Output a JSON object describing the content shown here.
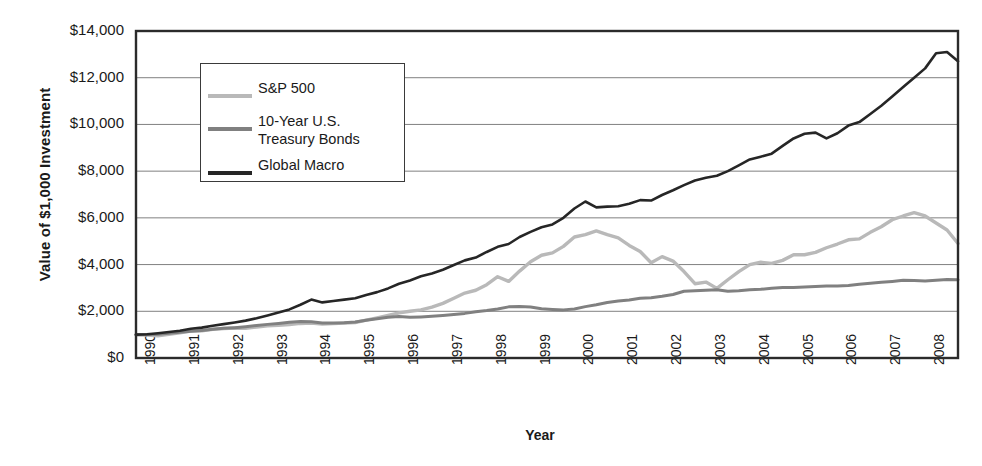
{
  "chart_data": {
    "type": "line",
    "title": "",
    "xlabel": "Year",
    "ylabel": "Value of $1,000 Investment",
    "xlim": [
      1990,
      2008.75
    ],
    "ylim": [
      0,
      14000
    ],
    "grid": true,
    "legend_position": "upper-left-inside",
    "y_ticks": [
      "$0",
      "$2,000",
      "$4,000",
      "$6,000",
      "$8,000",
      "$10,000",
      "$12,000",
      "$14,000"
    ],
    "y_tick_values": [
      0,
      2000,
      4000,
      6000,
      8000,
      10000,
      12000,
      14000
    ],
    "x_ticks": [
      "1990",
      "1991",
      "1992",
      "1993",
      "1994",
      "1995",
      "1996",
      "1997",
      "1998",
      "1999",
      "2000",
      "2001",
      "2002",
      "2003",
      "2004",
      "2005",
      "2006",
      "2007",
      "2008"
    ],
    "x_tick_values": [
      1990,
      1991,
      1992,
      1993,
      1994,
      1995,
      1996,
      1997,
      1998,
      1999,
      2000,
      2001,
      2002,
      2003,
      2004,
      2005,
      2006,
      2007,
      2008
    ],
    "colors": {
      "sp500": "#b9b9b9",
      "treasury": "#808080",
      "global_macro": "#262626",
      "axis": "#2b2b2b",
      "grid": "#808080",
      "background": "#ffffff"
    },
    "series": [
      {
        "name": "S&P 500",
        "color": "#b9b9b9",
        "x": [
          1990.0,
          1990.25,
          1990.5,
          1990.75,
          1991.0,
          1991.25,
          1991.5,
          1991.75,
          1992.0,
          1992.25,
          1992.5,
          1992.75,
          1993.0,
          1993.25,
          1993.5,
          1993.75,
          1994.0,
          1994.25,
          1994.5,
          1994.75,
          1995.0,
          1995.25,
          1995.5,
          1995.75,
          1996.0,
          1996.25,
          1996.5,
          1996.75,
          1997.0,
          1997.25,
          1997.5,
          1997.75,
          1998.0,
          1998.25,
          1998.5,
          1998.75,
          1999.0,
          1999.25,
          1999.5,
          1999.75,
          2000.0,
          2000.25,
          2000.5,
          2000.75,
          2001.0,
          2001.25,
          2001.5,
          2001.75,
          2002.0,
          2002.25,
          2002.5,
          2002.75,
          2003.0,
          2003.25,
          2003.5,
          2003.75,
          2004.0,
          2004.25,
          2004.5,
          2004.75,
          2005.0,
          2005.25,
          2005.5,
          2005.75,
          2006.0,
          2006.25,
          2006.5,
          2006.75,
          2007.0,
          2007.25,
          2007.5,
          2007.75,
          2008.0,
          2008.25,
          2008.5,
          2008.75
        ],
        "y": [
          1000,
          980,
          950,
          1010,
          1080,
          1150,
          1160,
          1230,
          1260,
          1280,
          1270,
          1330,
          1380,
          1400,
          1430,
          1480,
          1500,
          1450,
          1470,
          1500,
          1520,
          1620,
          1720,
          1820,
          1930,
          2000,
          2060,
          2180,
          2340,
          2560,
          2780,
          2900,
          3140,
          3480,
          3280,
          3720,
          4120,
          4400,
          4500,
          4780,
          5180,
          5280,
          5440,
          5280,
          5140,
          4820,
          4560,
          4080,
          4340,
          4150,
          3700,
          3180,
          3250,
          2980,
          3350,
          3700,
          4000,
          4100,
          4050,
          4180,
          4420,
          4420,
          4520,
          4720,
          4880,
          5060,
          5100,
          5380,
          5620,
          5920,
          6080,
          6220,
          6080,
          5780,
          5480,
          4900
        ]
      },
      {
        "name": "10-Year U.S. Treasury Bonds",
        "color": "#808080",
        "x": [
          1990.0,
          1990.25,
          1990.5,
          1990.75,
          1991.0,
          1991.25,
          1991.5,
          1991.75,
          1992.0,
          1992.25,
          1992.5,
          1992.75,
          1993.0,
          1993.25,
          1993.5,
          1993.75,
          1994.0,
          1994.25,
          1994.5,
          1994.75,
          1995.0,
          1995.25,
          1995.5,
          1995.75,
          1996.0,
          1996.25,
          1996.5,
          1996.75,
          1997.0,
          1997.25,
          1997.5,
          1997.75,
          1998.0,
          1998.25,
          1998.5,
          1998.75,
          1999.0,
          1999.25,
          1999.5,
          1999.75,
          2000.0,
          2000.25,
          2000.5,
          2000.75,
          2001.0,
          2001.25,
          2001.5,
          2001.75,
          2002.0,
          2002.25,
          2002.5,
          2002.75,
          2003.0,
          2003.25,
          2003.5,
          2003.75,
          2004.0,
          2004.25,
          2004.5,
          2004.75,
          2005.0,
          2005.25,
          2005.5,
          2005.75,
          2006.0,
          2006.25,
          2006.5,
          2006.75,
          2007.0,
          2007.25,
          2007.5,
          2007.75,
          2008.0,
          2008.25,
          2008.5,
          2008.75
        ],
        "y": [
          1000,
          1010,
          1020,
          1060,
          1100,
          1140,
          1180,
          1230,
          1270,
          1300,
          1340,
          1390,
          1440,
          1480,
          1530,
          1560,
          1550,
          1500,
          1500,
          1510,
          1540,
          1620,
          1680,
          1740,
          1780,
          1740,
          1760,
          1790,
          1820,
          1860,
          1910,
          1980,
          2030,
          2100,
          2190,
          2200,
          2180,
          2110,
          2080,
          2060,
          2100,
          2200,
          2280,
          2380,
          2440,
          2480,
          2560,
          2580,
          2640,
          2720,
          2860,
          2880,
          2900,
          2920,
          2860,
          2880,
          2920,
          2940,
          2990,
          3020,
          3020,
          3040,
          3060,
          3080,
          3080,
          3100,
          3160,
          3200,
          3240,
          3280,
          3330,
          3320,
          3300,
          3330,
          3360,
          3350
        ]
      },
      {
        "name": "Global Macro",
        "color": "#262626",
        "x": [
          1990.0,
          1990.25,
          1990.5,
          1990.75,
          1991.0,
          1991.25,
          1991.5,
          1991.75,
          1992.0,
          1992.25,
          1992.5,
          1992.75,
          1993.0,
          1993.25,
          1993.5,
          1993.75,
          1994.0,
          1994.25,
          1994.5,
          1994.75,
          1995.0,
          1995.25,
          1995.5,
          1995.75,
          1996.0,
          1996.25,
          1996.5,
          1996.75,
          1997.0,
          1997.25,
          1997.5,
          1997.75,
          1998.0,
          1998.25,
          1998.5,
          1998.75,
          1999.0,
          1999.25,
          1999.5,
          1999.75,
          2000.0,
          2000.25,
          2000.5,
          2000.75,
          2001.0,
          2001.25,
          2001.5,
          2001.75,
          2002.0,
          2002.25,
          2002.5,
          2002.75,
          2003.0,
          2003.25,
          2003.5,
          2003.75,
          2004.0,
          2004.25,
          2004.5,
          2004.75,
          2005.0,
          2005.25,
          2005.5,
          2005.75,
          2006.0,
          2006.25,
          2006.5,
          2006.75,
          2007.0,
          2007.25,
          2007.5,
          2007.75,
          2008.0,
          2008.25,
          2008.5,
          2008.75
        ],
        "y": [
          1000,
          1020,
          1060,
          1110,
          1170,
          1250,
          1300,
          1380,
          1450,
          1520,
          1600,
          1700,
          1820,
          1950,
          2080,
          2280,
          2500,
          2380,
          2440,
          2500,
          2560,
          2700,
          2820,
          2980,
          3180,
          3320,
          3500,
          3620,
          3780,
          3980,
          4180,
          4300,
          4540,
          4760,
          4880,
          5180,
          5400,
          5600,
          5720,
          6000,
          6400,
          6700,
          6450,
          6480,
          6500,
          6600,
          6760,
          6740,
          6980,
          7180,
          7400,
          7600,
          7720,
          7800,
          8000,
          8250,
          8500,
          8620,
          8750,
          9080,
          9400,
          9600,
          9650,
          9400,
          9620,
          9950,
          10100,
          10450,
          10800,
          11200,
          11600,
          12000,
          12400,
          13050,
          13100,
          12700
        ]
      }
    ]
  },
  "legend": {
    "entries": [
      {
        "label": "S&P 500",
        "label2": "",
        "color": "#b9b9b9"
      },
      {
        "label": "10-Year U.S.",
        "label2": "Treasury Bonds",
        "color": "#808080"
      },
      {
        "label": "Global Macro",
        "label2": "",
        "color": "#262626"
      }
    ]
  },
  "axes": {
    "y_title": "Value of $1,000 Investment",
    "x_title": "Year"
  }
}
